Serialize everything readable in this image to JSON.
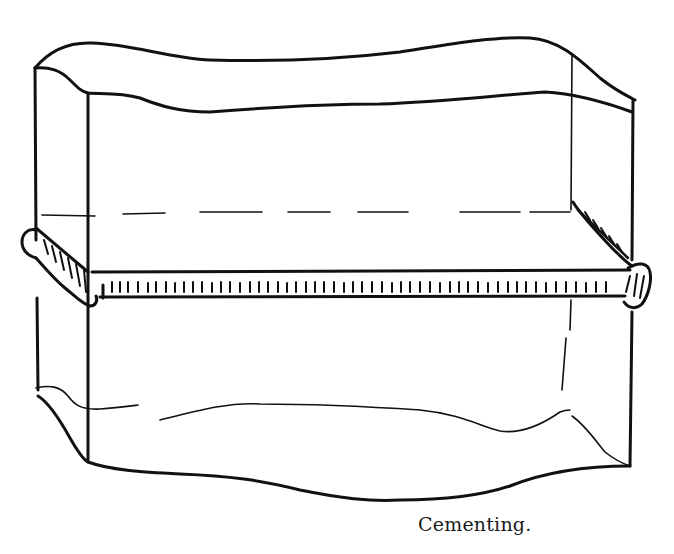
{
  "figure": {
    "caption": "Cementing.",
    "ink_color": "#111111",
    "background": "#ffffff"
  }
}
